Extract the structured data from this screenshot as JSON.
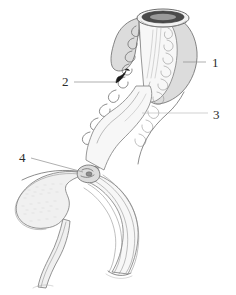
{
  "figure": {
    "title": "Anatomical line drawing of the female urogenital tract",
    "background_color": "#ffffff",
    "ink_color": "#6e6e6e",
    "label_color": "#2b2b2b",
    "organ_fill_color": "#dcdcdc",
    "width": 236,
    "height": 295
  },
  "labels": [
    {
      "id": "label-1",
      "text": "1",
      "x": 212,
      "y": 67,
      "leader": {
        "x1": 183,
        "y1": 62,
        "x2": 206,
        "y2": 62
      },
      "style": "plain"
    },
    {
      "id": "label-2",
      "text": "2",
      "x": 62,
      "y": 86,
      "leader": {
        "x1": 74,
        "y1": 82,
        "x2": 117,
        "y2": 82
      },
      "style": "arrow"
    },
    {
      "id": "label-3",
      "text": "3",
      "x": 213,
      "y": 119,
      "leader": {
        "x1": 142,
        "y1": 113,
        "x2": 208,
        "y2": 113
      },
      "style": "faint"
    },
    {
      "id": "label-4",
      "text": "4",
      "x": 19,
      "y": 162,
      "leader": {
        "x1": 31,
        "y1": 158,
        "x2": 83,
        "y2": 172
      },
      "style": "plain"
    }
  ],
  "structures": [
    {
      "id": "uterus-body",
      "name": "uterus-body"
    },
    {
      "id": "cervical-canal",
      "name": "cervical-canal"
    },
    {
      "id": "vaginal-canal",
      "name": "vaginal-canal"
    },
    {
      "id": "urinary-bladder",
      "name": "urinary-bladder"
    },
    {
      "id": "urethra",
      "name": "urethra"
    },
    {
      "id": "rectum-tube",
      "name": "rectum-tube"
    },
    {
      "id": "cut-opening",
      "name": "cut-opening"
    }
  ]
}
